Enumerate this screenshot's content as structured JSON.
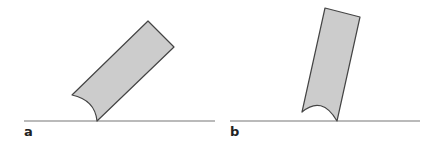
{
  "panels": [
    {
      "label": "a",
      "description": "Rectangular block tilted ~45° resting on a line with concave curved contact end"
    },
    {
      "label": "b",
      "description": "Rectangular block tilted nearly upright resting on a line with concave curved contact end"
    }
  ],
  "colors": {
    "fill": "#cccccc",
    "stroke": "#444444",
    "line": "#666666",
    "background": "#ffffff"
  }
}
